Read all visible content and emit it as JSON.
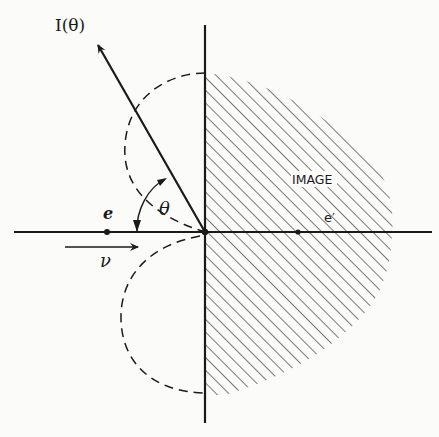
{
  "figure": {
    "type": "physics-diagram"
  },
  "labels": {
    "intensity": "I(θ)",
    "angle": "θ",
    "charge": "e",
    "image_charge": "e′",
    "velocity": "ν",
    "image_region": "IMAGE"
  },
  "colors": {
    "ink": "#1a1a1a",
    "background": "#fbfbfa",
    "hatch": "#333333"
  },
  "geometry": {
    "origin": [
      205,
      232
    ],
    "vertical_axis": {
      "x": 205,
      "y1": 25,
      "y2": 423
    },
    "horizontal_axis": {
      "y": 232,
      "x1": 14,
      "x2": 432
    },
    "charge_position": [
      107,
      232
    ],
    "image_charge_position": [
      298,
      232
    ],
    "intensity_arrow": {
      "from": [
        205,
        232
      ],
      "to": [
        96,
        42
      ]
    },
    "velocity_arrow": {
      "from": [
        65,
        247
      ],
      "to": [
        140,
        247
      ]
    }
  }
}
